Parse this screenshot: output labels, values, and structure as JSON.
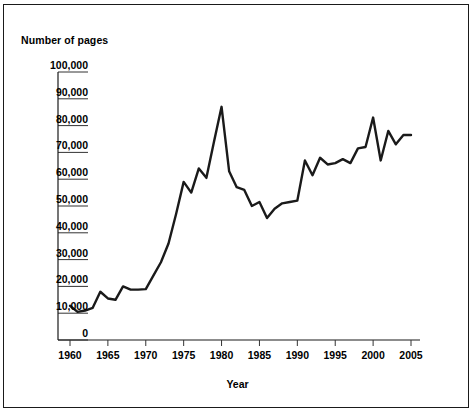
{
  "chart_data": {
    "type": "line",
    "title": "",
    "ylabel": "Number of pages",
    "xlabel": "Year",
    "xlim": [
      1960,
      2005
    ],
    "ylim": [
      0,
      100000
    ],
    "grid": "horizontal-left-stubs",
    "legend": "none",
    "y_ticks": [
      "0",
      "10,000",
      "20,000",
      "30,000",
      "40,000",
      "50,000",
      "60,000",
      "70,000",
      "80,000",
      "90,000",
      "100,000"
    ],
    "y_tick_values": [
      0,
      10000,
      20000,
      30000,
      40000,
      50000,
      60000,
      70000,
      80000,
      90000,
      100000
    ],
    "x_ticks": [
      "1960",
      "1965",
      "1970",
      "1975",
      "1980",
      "1985",
      "1990",
      "1995",
      "2000",
      "2005"
    ],
    "x_tick_values": [
      1960,
      1965,
      1970,
      1975,
      1980,
      1985,
      1990,
      1995,
      2000,
      2005
    ],
    "series": [
      {
        "name": "Number of pages",
        "color": "#1a1a1a",
        "x": [
          1960,
          1961,
          1962,
          1963,
          1964,
          1965,
          1966,
          1967,
          1968,
          1969,
          1970,
          1971,
          1972,
          1973,
          1974,
          1975,
          1976,
          1977,
          1978,
          1979,
          1980,
          1981,
          1982,
          1983,
          1984,
          1985,
          1986,
          1987,
          1988,
          1989,
          1990,
          1991,
          1992,
          1993,
          1994,
          1995,
          1996,
          1997,
          1998,
          1999,
          2000,
          2001,
          2002,
          2003,
          2004,
          2005
        ],
        "values": [
          12800,
          10500,
          11000,
          12000,
          18000,
          15500,
          15000,
          20000,
          18800,
          18800,
          19000,
          24000,
          29000,
          36000,
          47000,
          59000,
          55000,
          64000,
          60500,
          74000,
          87000,
          63000,
          57000,
          56000,
          50000,
          51500,
          45500,
          49000,
          51000,
          51500,
          52000,
          67000,
          61500,
          68000,
          65500,
          66000,
          67500,
          66000,
          71500,
          72000,
          83000,
          67000,
          78000,
          73000,
          76500,
          76500
        ]
      }
    ]
  }
}
